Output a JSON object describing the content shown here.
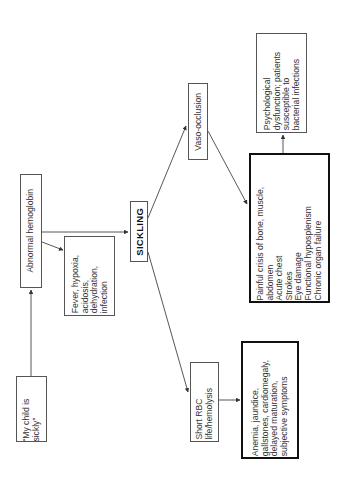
{
  "diagram": {
    "orientation": "rotated-90-ccw",
    "nodes": {
      "my_child": "“My child is\nsickly”",
      "abnormal_hb": "Abnormal hemoglobin",
      "fever": "Fever, hypoxia,\nacidosis,\ndehydration,\ninfection",
      "sickling": "SICKLING",
      "short_rbc": "Short RBC\nlife/hemolysis",
      "anemia": "Anemia, jaundice,\ngallstones, cardiomegaly,\ndelayed maturation,\nsubjective symptoms",
      "vaso": "Vaso-occlusion",
      "painful": "Painful crisis of bone, muscle,\nabdomen\nAcute chest\nStrokes\nEye damage\nFunctional hyposplenism\nChronic organ failure",
      "psych": "Psychological\ndysfunction; patients\nsusceptible to\nbacterial infections"
    },
    "edges": [
      {
        "from": "my_child",
        "to": "abnormal_hb"
      },
      {
        "from": "abnormal_hb",
        "to": "sickling"
      },
      {
        "from": "abnormal_hb",
        "to": "fever"
      },
      {
        "from": "sickling",
        "to": "short_rbc"
      },
      {
        "from": "sickling",
        "to": "vaso"
      },
      {
        "from": "short_rbc",
        "to": "anemia"
      },
      {
        "from": "vaso",
        "to": "painful"
      },
      {
        "from": "painful",
        "to": "psych"
      }
    ],
    "colors": {
      "line": "#444444",
      "text": "#333333",
      "background": "#ffffff"
    }
  }
}
